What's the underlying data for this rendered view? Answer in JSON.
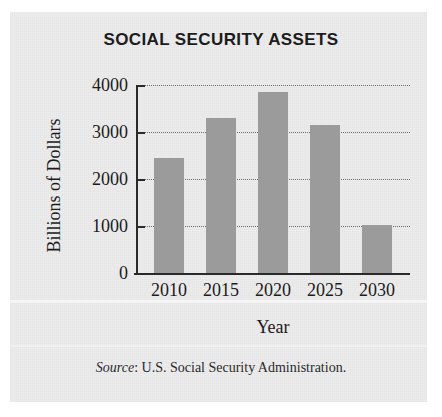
{
  "figure": {
    "title": "SOCIAL SECURITY ASSETS",
    "source_label": "Source",
    "source_separator": ": ",
    "source_text": "U.S. Social Security Administration."
  },
  "chart_data": {
    "type": "bar",
    "title": "SOCIAL SECURITY ASSETS",
    "xlabel": "Year",
    "ylabel": "Billions of Dollars",
    "categories": [
      "2010",
      "2015",
      "2020",
      "2025",
      "2030"
    ],
    "values": [
      2450,
      3300,
      3850,
      3150,
      1020
    ],
    "ylim": [
      0,
      4000
    ],
    "yticks": [
      "0",
      "1000",
      "2000",
      "3000",
      "4000"
    ],
    "ytick_values": [
      0,
      1000,
      2000,
      3000,
      4000
    ],
    "grid": true,
    "grid_style": "dotted-horizontal",
    "legend": "none",
    "bar_color": "#9b9b9b",
    "axis_color": "#2a2a2a",
    "background_color": "#ececed"
  }
}
